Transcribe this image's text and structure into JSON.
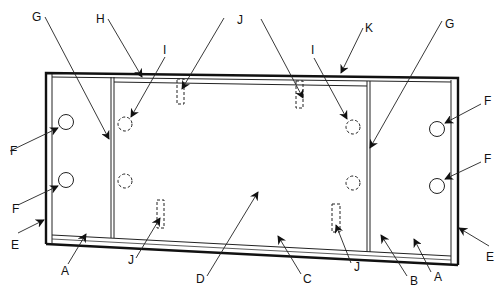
{
  "diagram": {
    "type": "technical-line-drawing",
    "colors": {
      "ink": "#111111",
      "background": "#ffffff"
    },
    "labels": {
      "A_left": "A",
      "A_right": "A",
      "B": "B",
      "C": "C",
      "D": "D",
      "E_left": "E",
      "E_right": "E",
      "F_left_top": "F",
      "F_left_bottom": "F",
      "F_right_top": "F",
      "F_right_bottom": "F",
      "G_left": "G",
      "G_right": "G",
      "H": "H",
      "I_left": "I",
      "I_right": "I",
      "J_top": "J",
      "J_bottom_left": "J",
      "J_bottom_right": "J",
      "K": "K"
    }
  }
}
